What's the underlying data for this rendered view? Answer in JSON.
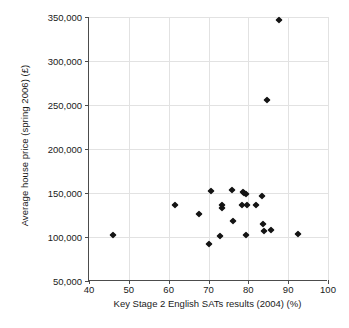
{
  "chart_data": {
    "type": "scatter",
    "title": "",
    "xlabel": "Key Stage 2 English SATs results (2004) (%)",
    "ylabel": "Average house price (spring 2006) (£)",
    "xlim": [
      40,
      100
    ],
    "ylim": [
      50000,
      350000
    ],
    "xticks": [
      40,
      50,
      60,
      70,
      80,
      90,
      100
    ],
    "yticks": [
      50000,
      100000,
      150000,
      200000,
      250000,
      300000,
      350000
    ],
    "xticklabels": [
      "40",
      "50",
      "60",
      "70",
      "80",
      "90",
      "100"
    ],
    "yticklabels": [
      "50,000",
      "100,000",
      "150,000",
      "200,000",
      "250,000",
      "300,000",
      "350,000"
    ],
    "grid": true,
    "legend": false,
    "marker": "diamond",
    "marker_color": "#141414",
    "series": [
      {
        "name": "Local authority areas",
        "points": [
          {
            "x": 45.9,
            "y": 102000
          },
          {
            "x": 61.6,
            "y": 136500
          },
          {
            "x": 67.6,
            "y": 126000
          },
          {
            "x": 70.1,
            "y": 92500
          },
          {
            "x": 70.7,
            "y": 152500
          },
          {
            "x": 72.9,
            "y": 101500
          },
          {
            "x": 73.4,
            "y": 136000
          },
          {
            "x": 73.5,
            "y": 133000
          },
          {
            "x": 75.9,
            "y": 153500
          },
          {
            "x": 76.2,
            "y": 118000
          },
          {
            "x": 78.3,
            "y": 136000
          },
          {
            "x": 78.6,
            "y": 151500
          },
          {
            "x": 79.0,
            "y": 150000
          },
          {
            "x": 79.3,
            "y": 149000
          },
          {
            "x": 79.5,
            "y": 102500
          },
          {
            "x": 79.6,
            "y": 136500
          },
          {
            "x": 81.8,
            "y": 136500
          },
          {
            "x": 83.5,
            "y": 146500
          },
          {
            "x": 83.7,
            "y": 114500
          },
          {
            "x": 83.9,
            "y": 106500
          },
          {
            "x": 84.6,
            "y": 256000
          },
          {
            "x": 85.6,
            "y": 108500
          },
          {
            "x": 87.7,
            "y": 347000
          },
          {
            "x": 92.5,
            "y": 103000
          }
        ]
      }
    ]
  },
  "caption": {
    "text": ""
  }
}
